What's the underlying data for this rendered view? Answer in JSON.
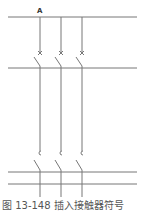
{
  "diagram": {
    "type": "electrical-schematic",
    "line_color": "#777777",
    "bus_lines": [
      {
        "id": "top-bus",
        "y": 17
      },
      {
        "id": "mid-bus",
        "y": 68
      },
      {
        "id": "lower-bus-1",
        "y": 172
      },
      {
        "id": "lower-bus-2",
        "y": 184
      }
    ],
    "phases": [
      {
        "x": 40,
        "label": "A"
      },
      {
        "x": 61,
        "label": ""
      },
      {
        "x": 82,
        "label": ""
      }
    ],
    "components": {
      "circuit_breaker_y": 53,
      "contactor_y": 153
    },
    "label_a": "A"
  },
  "caption": {
    "text": "图 13-148   插入接触器符号"
  }
}
